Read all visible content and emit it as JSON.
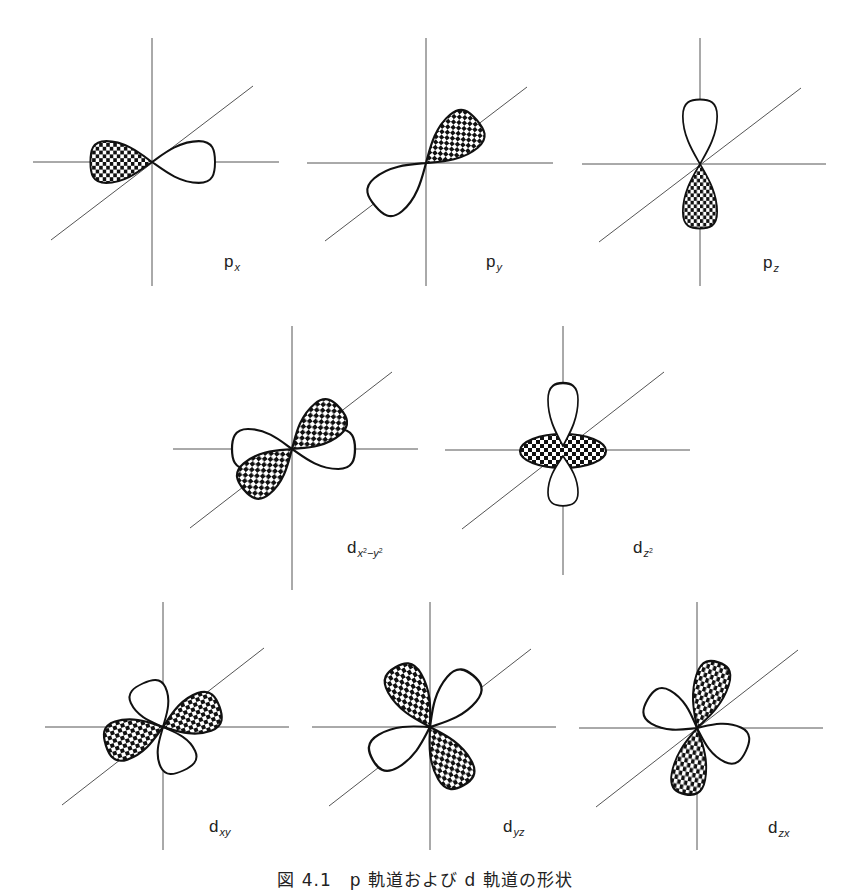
{
  "figure": {
    "caption": "図 4.1　p 軌道および d 軌道の形状",
    "shading_legend": {
      "checkered": "negative phase lobe",
      "white": "positive phase lobe"
    },
    "colors": {
      "background": "#ffffff",
      "axis": "#555555",
      "lobe_outline": "#111111",
      "checker_dark": "#111111",
      "checker_light": "#ffffff"
    }
  },
  "orbitals": [
    {
      "id": "px",
      "label_main": "p",
      "label_sub": "x",
      "row": 1
    },
    {
      "id": "py",
      "label_main": "p",
      "label_sub": "y",
      "row": 1
    },
    {
      "id": "pz",
      "label_main": "p",
      "label_sub": "z",
      "row": 1
    },
    {
      "id": "dx2y2",
      "label_main": "d",
      "label_sub_parts": [
        "x",
        "2",
        "−y",
        "2"
      ],
      "row": 2
    },
    {
      "id": "dz2",
      "label_main": "d",
      "label_sub_parts": [
        "z",
        "2"
      ],
      "row": 2
    },
    {
      "id": "dxy",
      "label_main": "d",
      "label_sub": "xy",
      "row": 3
    },
    {
      "id": "dyz",
      "label_main": "d",
      "label_sub": "yz",
      "row": 3
    },
    {
      "id": "dzx",
      "label_main": "d",
      "label_sub": "zx",
      "row": 3
    }
  ]
}
